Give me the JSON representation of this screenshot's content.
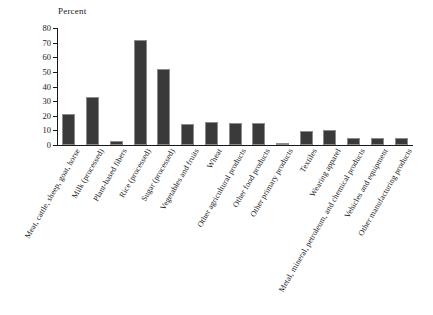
{
  "chart_data": {
    "type": "bar",
    "title": "",
    "ylabel": "Percent",
    "xlabel": "",
    "ylim": [
      0,
      80
    ],
    "yticks": [
      0,
      10,
      20,
      30,
      40,
      50,
      60,
      70,
      80
    ],
    "grid": false,
    "legend": null,
    "bar_color": "#3a3a3a",
    "bar_edge_color": "#8c8c8c",
    "categories": [
      "Meat, cattle, sheep, goat, horse",
      "Milk (processed)",
      "Plant-based fibers",
      "Rice (processed)",
      "Sugar (processed)",
      "Vegetables and fruits",
      "Wheat",
      "Other agricultural products",
      "Other food products",
      "Other primary products",
      "Textiles",
      "Wearing apparel",
      "Metal, mineral, petroleum, and chemical products",
      "Vehicles and equipment",
      "Other manufacturing products"
    ],
    "values": [
      21.5,
      33,
      2.5,
      71.5,
      52,
      14.5,
      15.5,
      15,
      15,
      1,
      9.5,
      10,
      4.5,
      4.5,
      4.5
    ]
  },
  "axis": {
    "y_title": "Percent"
  }
}
